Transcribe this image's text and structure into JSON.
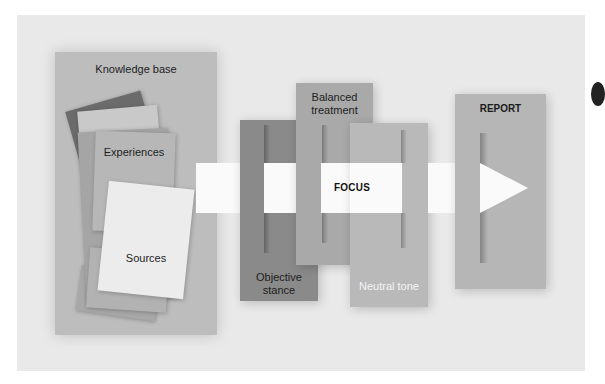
{
  "diagram": {
    "type": "process-flow",
    "knowledge_base": {
      "title": "Knowledge base",
      "items": [
        {
          "label": "Experiences"
        },
        {
          "label": "Sources"
        }
      ]
    },
    "arrow": {
      "label": "FOCUS",
      "direction": "right"
    },
    "filters": [
      {
        "label_line1": "Objective",
        "label_line2": "stance",
        "color": "#8a8a8a"
      },
      {
        "label_line1": "Balanced",
        "label_line2": "treatment",
        "color": "#a9a9a9"
      },
      {
        "label_line1": "Neutral tone",
        "label_line2": "",
        "color": "#b9b9b9"
      }
    ],
    "output": {
      "label": "REPORT",
      "color": "#b6b6b6"
    }
  },
  "colors": {
    "panel_background": "#e9e9e9",
    "knowledge_base": "#bdbdbd",
    "arrow": "#fafafa",
    "dark_doc": "#6b6b6b"
  }
}
